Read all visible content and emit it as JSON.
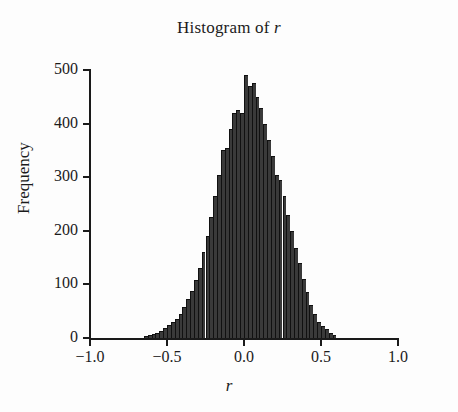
{
  "chart_data": {
    "type": "bar",
    "title": "Histogram of r",
    "title_plain": "Histogram of ",
    "title_italic": "r",
    "xlabel": "r",
    "ylabel": "Frequency",
    "xlim": [
      -1.0,
      1.0
    ],
    "ylim": [
      0,
      500
    ],
    "grid": false,
    "legend": null,
    "bin_width": 0.025,
    "xticks": [
      -1.0,
      -0.5,
      0.0,
      0.5,
      1.0
    ],
    "xtick_labels": [
      "−1.0",
      "−0.5",
      "0.0",
      "0.5",
      "1.0"
    ],
    "yticks": [
      0,
      100,
      200,
      300,
      400,
      500
    ],
    "ytick_labels": [
      "0",
      "100",
      "200",
      "300",
      "400",
      "500"
    ],
    "bar_color": "#3a3a3a",
    "bar_edge_color": "#111111",
    "axis_color": "#1a1a1a",
    "bin_centers": [
      -0.6375,
      -0.6125,
      -0.5875,
      -0.5625,
      -0.5375,
      -0.5125,
      -0.4875,
      -0.4625,
      -0.4375,
      -0.4125,
      -0.3875,
      -0.3625,
      -0.3375,
      -0.3125,
      -0.2875,
      -0.2625,
      -0.2375,
      -0.2125,
      -0.1875,
      -0.1625,
      -0.1375,
      -0.1125,
      -0.0875,
      -0.0625,
      -0.0375,
      -0.0125,
      0.0125,
      0.0375,
      0.0625,
      0.0875,
      0.1125,
      0.1375,
      0.1625,
      0.1875,
      0.2125,
      0.2375,
      0.2625,
      0.2875,
      0.3125,
      0.3375,
      0.3625,
      0.3875,
      0.4125,
      0.4375,
      0.4625,
      0.4875,
      0.5125,
      0.5375,
      0.5625,
      0.5875
    ],
    "values": [
      4,
      6,
      8,
      10,
      14,
      18,
      24,
      30,
      36,
      45,
      58,
      72,
      88,
      108,
      130,
      160,
      190,
      225,
      265,
      305,
      350,
      355,
      390,
      420,
      425,
      420,
      490,
      470,
      475,
      450,
      430,
      400,
      370,
      340,
      305,
      295,
      265,
      230,
      200,
      168,
      140,
      110,
      85,
      62,
      45,
      30,
      22,
      16,
      10,
      5
    ],
    "peak_value": 490,
    "peak_bin_center": 0.0125
  }
}
